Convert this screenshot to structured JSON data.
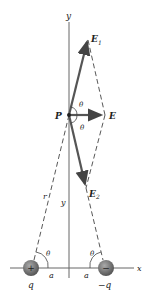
{
  "labels": {
    "y_top": "y",
    "E1": "E",
    "E1_sub": "1",
    "E": "E",
    "E2": "E",
    "E2_sub": "2",
    "P": "P",
    "theta_upper": "θ",
    "theta_lower": "θ",
    "r": "r",
    "y_mid": "y",
    "theta_left": "θ",
    "theta_right": "θ",
    "a_left": "a",
    "a_right": "a",
    "x": "x",
    "q": "q",
    "neg_q": "−q",
    "plus_sign": "+",
    "minus_sign": "−"
  },
  "colors": {
    "vector": "#555555",
    "charge": "#777777",
    "axis": "#555555"
  }
}
